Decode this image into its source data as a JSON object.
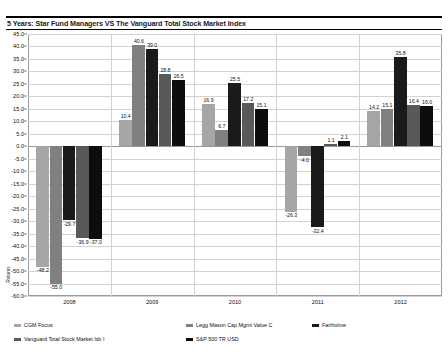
{
  "chart_data": {
    "type": "bar",
    "title": "5 Years: Star Fund Managers VS The Vanguard Total Stock Market Index",
    "xlabel": "",
    "ylabel": "Returns",
    "ylim": [
      -60.0,
      45.0
    ],
    "ytick_step": 5.0,
    "grid": true,
    "legend_position": "bottom",
    "categories": [
      "2008",
      "2009",
      "2010",
      "2011",
      "2012"
    ],
    "yticks": [
      "45.0",
      "40.0",
      "35.0",
      "30.0",
      "25.0",
      "20.0",
      "15.0",
      "10.0",
      "5.0",
      "0.0",
      "-5.0",
      "-10.0",
      "-15.0",
      "-20.0",
      "-25.0",
      "-30.0",
      "-35.0",
      "-40.0",
      "-45.0",
      "-50.0",
      "-55.0",
      "-60.0"
    ],
    "series": [
      {
        "name": "CGM Focus",
        "color": "#a6a6a6",
        "values": [
          -48.2,
          10.4,
          16.9,
          -26.3,
          14.2
        ],
        "labels": [
          "-48.2",
          "10.4",
          "16.9",
          "-26.3",
          "14.2"
        ]
      },
      {
        "name": "Legg Mason Cap Mgmt Value C",
        "color": "#808080",
        "values": [
          -55.0,
          40.6,
          6.7,
          -4.0,
          15.1
        ],
        "labels": [
          "-55.0",
          "40.6",
          "6.7",
          "-4.0",
          "15.1"
        ]
      },
      {
        "name": "Fairholme",
        "color": "#1a1a1a",
        "values": [
          -29.7,
          39.0,
          25.5,
          -32.4,
          35.8
        ],
        "labels": [
          "-29.7",
          "39.0",
          "25.5",
          "-32.4",
          "35.8"
        ]
      },
      {
        "name": "Vanguard Total Stock Market Idx I",
        "color": "#595959",
        "values": [
          -36.9,
          28.8,
          17.2,
          1.1,
          16.4
        ],
        "labels": [
          "-36.9",
          "28.8",
          "17.2",
          "1.1",
          "16.4"
        ]
      },
      {
        "name": "S&P 500 TR USD",
        "color": "#0d0d0d",
        "values": [
          -37.0,
          26.5,
          15.1,
          2.1,
          16.0
        ],
        "labels": [
          "-37.0",
          "26.5",
          "15.1",
          "2.1",
          "16.0"
        ]
      }
    ]
  },
  "legend": {
    "items": [
      {
        "label": "CGM Focus",
        "color": "#a6a6a6"
      },
      {
        "label": "Legg Mason Cap Mgmt Value C",
        "color": "#808080"
      },
      {
        "label": "Fairholme",
        "color": "#1a1a1a"
      },
      {
        "label": "Vanguard Total Stock Market Idx I",
        "color": "#595959"
      },
      {
        "label": "S&P 500 TR USD",
        "color": "#0d0d0d"
      }
    ]
  }
}
